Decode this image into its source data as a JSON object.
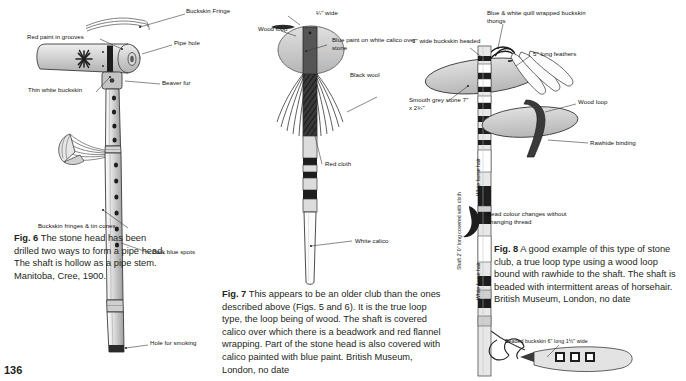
{
  "page": {
    "number": "136"
  },
  "figures": [
    {
      "id": "fig6",
      "caption_label": "Fig. 6",
      "caption_text": " The stone head has been drilled two ways to form a pipe head. The shaft is hollow as a pipe stem. Manitoba, Cree, 1900.",
      "labels": [
        {
          "name": "buckskin-fringe",
          "text": "Buckskin Fringe"
        },
        {
          "name": "red-paint-in-grooves",
          "text": "Red paint in grooves"
        },
        {
          "name": "pipe-hole",
          "text": "Pipe hole"
        },
        {
          "name": "beaver-fur",
          "text": "Beaver fur"
        },
        {
          "name": "thin-white-buckskin",
          "text": "Thin white buckskin"
        },
        {
          "name": "buckskin-fringes-tin-cones",
          "text": "Buckskin fringes & tin cones"
        },
        {
          "name": "dark-blue-spots",
          "text": "Dark blue spots"
        },
        {
          "name": "hole-for-smoking",
          "text": "Hole for smoking"
        }
      ]
    },
    {
      "id": "fig7",
      "caption_label": "Fig. 7",
      "caption_text": " This appears to be an older club than the ones described above (Figs. 5 and 6). It is the true loop type, the loop being of wood. The shaft is covered calico over which there is a beadwork and red flannel wrapping. Part of the stone head is also covered with calico painted with blue paint. British Museum, London, no date",
      "labels": [
        {
          "name": "wood-loop",
          "text": "Wood loop"
        },
        {
          "name": "width-dimension",
          "text": "¼\" wide"
        },
        {
          "name": "blue-paint-on-calico",
          "text": "Blue paint on\nwhite calico over stone"
        },
        {
          "name": "black-wool",
          "text": "Black wool"
        },
        {
          "name": "red-cloth",
          "text": "Red cloth"
        },
        {
          "name": "white-calico",
          "text": "White calico"
        }
      ]
    },
    {
      "id": "fig8",
      "caption_label": "Fig. 8",
      "caption_text": " A good example of this type of stone club, a true loop type using a wood loop bound with rawhide to the shaft. The shaft is beaded with intermittent areas of horsehair. British Museum, London, no date",
      "labels": [
        {
          "name": "blue-white-quill-wrapped-thongs",
          "text": "Blue & white quill wrapped\nbuckskin thongs"
        },
        {
          "name": "one-inch-wide-buckskin-beaded",
          "text": "1\" wide buckskin\nbeaded"
        },
        {
          "name": "five-inch-long-feathers",
          "text": "5\" long feathers"
        },
        {
          "name": "smooth-grey-stone",
          "text": "Smooth grey\nstone 7\" x 2¾\""
        },
        {
          "name": "wood-loop",
          "text": "Wood loop"
        },
        {
          "name": "rawhide-binding",
          "text": "Rawhide binding"
        },
        {
          "name": "bead-colour-changes",
          "text": "Bead colour changes\nwithout changing thread"
        },
        {
          "name": "beaded-buckskin-strap",
          "text": "Beaded buckskin 6\" long  1½\" wide"
        },
        {
          "name": "shaft-length",
          "text": "Shaft 2' 0\" long covered with cloth"
        },
        {
          "name": "white-horse-hair-upper",
          "text": "White horse hair"
        },
        {
          "name": "white-horse-hair-lower",
          "text": "White horse hair"
        }
      ]
    }
  ],
  "colors": {
    "ink": "#231f20",
    "stone_fill": "#c9c9c9",
    "stone_fill_light": "#dcdcdc",
    "dark": "#2a2a2a",
    "shaft_fill": "#cfcfcf"
  }
}
